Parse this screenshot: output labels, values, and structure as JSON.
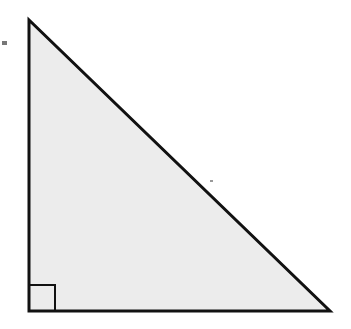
{
  "diagram": {
    "type": "right-triangle",
    "fill_color": "#ececec",
    "stroke_color": "#111111",
    "vertices": {
      "top": [
        29,
        20
      ],
      "bottom_left": [
        29,
        311
      ],
      "bottom_right": [
        330,
        311
      ]
    },
    "right_angle_marker": {
      "x": 29,
      "y": 285,
      "size": 26,
      "corner": "bottom-left"
    },
    "specks": [
      {
        "x": 2,
        "y": 41,
        "w": 5,
        "h": 4,
        "color": "#777777"
      },
      {
        "x": 210,
        "y": 180,
        "w": 3,
        "h": 2,
        "color": "#999999"
      },
      {
        "x": 128,
        "y": 135,
        "w": 2,
        "h": 2,
        "color": "#aaaaaa"
      }
    ]
  }
}
